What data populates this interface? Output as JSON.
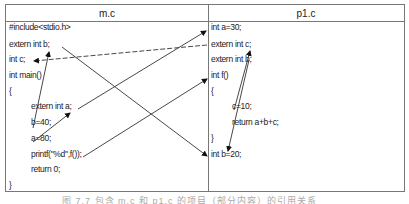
{
  "table": {
    "left_header": "m.c",
    "right_header": "p1.c",
    "left_lines": [
      {
        "text": "#include<stdio.h>",
        "x": 9,
        "y": 25
      },
      {
        "text": "extern int b;",
        "x": 9,
        "y": 42
      },
      {
        "text": "int c;",
        "x": 9,
        "y": 57
      },
      {
        "text": "int main()",
        "x": 9,
        "y": 73
      },
      {
        "text": "{",
        "x": 9,
        "y": 89
      },
      {
        "text": "extern int a;",
        "x": 31,
        "y": 104
      },
      {
        "text": "b=40;",
        "x": 31,
        "y": 120
      },
      {
        "text": "a=80;",
        "x": 31,
        "y": 136
      },
      {
        "text": "printf(\"%d\",f());",
        "x": 31,
        "y": 152
      },
      {
        "text": "return 0;",
        "x": 31,
        "y": 167
      },
      {
        "text": "}",
        "x": 9,
        "y": 183
      }
    ],
    "right_lines": [
      {
        "text": "int a=30;",
        "x": 211,
        "y": 25
      },
      {
        "text": "extern int c;",
        "x": 211,
        "y": 42
      },
      {
        "text": "extern int b;",
        "x": 211,
        "y": 57
      },
      {
        "text": "int f()",
        "x": 211,
        "y": 73
      },
      {
        "text": "{",
        "x": 211,
        "y": 89
      },
      {
        "text": "c=10;",
        "x": 232,
        "y": 104
      },
      {
        "text": "return a+b+c;",
        "x": 232,
        "y": 120
      },
      {
        "text": "}",
        "x": 211,
        "y": 136
      },
      {
        "text": "int b=20;",
        "x": 211,
        "y": 152
      }
    ]
  },
  "arrows": [
    {
      "from": "b=40",
      "to": "extern int b (m.c)",
      "x1": 33,
      "y1": 128,
      "x2": 49,
      "y2": 52,
      "style": "solid"
    },
    {
      "from": "a=80",
      "to": "extern int a",
      "x1": 33,
      "y1": 142,
      "x2": 70,
      "y2": 113,
      "style": "solid"
    },
    {
      "from": "extern int a",
      "to": "int a=30",
      "x1": 78,
      "y1": 109,
      "x2": 206,
      "y2": 31,
      "style": "solid"
    },
    {
      "from": "extern int b (m.c)",
      "to": "int b=20",
      "x1": 62,
      "y1": 47,
      "x2": 207,
      "y2": 156,
      "style": "solid"
    },
    {
      "from": "extern int c (p1.c)",
      "to": "int c",
      "x1": 207,
      "y1": 45,
      "x2": 34,
      "y2": 61,
      "style": "dashed"
    },
    {
      "from": "printf",
      "to": "int f()",
      "x1": 83,
      "y1": 157,
      "x2": 207,
      "y2": 79,
      "style": "solid"
    },
    {
      "from": "c=10",
      "to": "extern int c (p1.c)",
      "x1": 234,
      "y1": 110,
      "x2": 250,
      "y2": 51,
      "style": "solid"
    },
    {
      "from": "extern int b (p1.c)",
      "to": "int b=20",
      "x1": 249,
      "y1": 60,
      "x2": 228,
      "y2": 151,
      "style": "solid"
    }
  ],
  "caption": "图 7.7  包含 m.c 和 p1.c 的项目（部分内容）的引用关系"
}
